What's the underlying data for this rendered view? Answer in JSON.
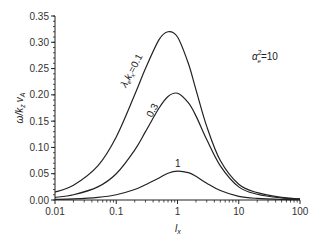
{
  "chart_data": {
    "type": "line",
    "title": "",
    "xlabel": "l_x",
    "ylabel": "ω/k_z v_A",
    "xscale": "log",
    "xlim": [
      0.01,
      100
    ],
    "ylim": [
      0,
      0.35
    ],
    "grid": false,
    "legend": "none (inline curve labels)",
    "x_ticks": [
      "0.01",
      "0.1",
      "1",
      "10",
      "100"
    ],
    "y_ticks": [
      "0.00",
      "0.05",
      "0.10",
      "0.15",
      "0.20",
      "0.25",
      "0.30",
      "0.35"
    ],
    "annotations": [
      {
        "text": "α_e²=10",
        "x": 25,
        "y": 0.28
      },
      {
        "text": "λ_e k_x=0.1",
        "series": "λ_e k_x=0.1"
      },
      {
        "text": "0.3",
        "series": "0.3"
      },
      {
        "text": "1",
        "series": "1"
      }
    ],
    "x": [
      0.01,
      0.02,
      0.05,
      0.1,
      0.2,
      0.3,
      0.5,
      0.7,
      1,
      1.5,
      2,
      3,
      5,
      10,
      20,
      50,
      100
    ],
    "series": [
      {
        "name": "λ_e k_x=0.1",
        "values": [
          0.015,
          0.028,
          0.065,
          0.12,
          0.2,
          0.25,
          0.305,
          0.32,
          0.31,
          0.26,
          0.21,
          0.14,
          0.075,
          0.03,
          0.014,
          0.005,
          0.002
        ]
      },
      {
        "name": "0.3",
        "values": [
          0.005,
          0.01,
          0.025,
          0.05,
          0.095,
          0.13,
          0.175,
          0.197,
          0.203,
          0.185,
          0.16,
          0.115,
          0.065,
          0.025,
          0.011,
          0.004,
          0.002
        ]
      },
      {
        "name": "1",
        "values": [
          0.001,
          0.002,
          0.005,
          0.01,
          0.02,
          0.029,
          0.042,
          0.051,
          0.055,
          0.052,
          0.045,
          0.032,
          0.018,
          0.007,
          0.003,
          0.001,
          0.0005
        ]
      }
    ]
  },
  "labels": {
    "ylabel_main": "ω/k",
    "ylabel_sub1": "z",
    "ylabel_mid": "v",
    "ylabel_sub2": "A",
    "xlabel_main": "l",
    "xlabel_sub": "x",
    "alpha_main": "α",
    "alpha_sup": "2",
    "alpha_sub": "e",
    "alpha_val": "=10",
    "curve1_a": "λ",
    "curve1_b": "e",
    "curve1_c": "k",
    "curve1_d": "x",
    "curve1_e": "=0.1",
    "curve2": "0.3",
    "curve3": "1"
  }
}
